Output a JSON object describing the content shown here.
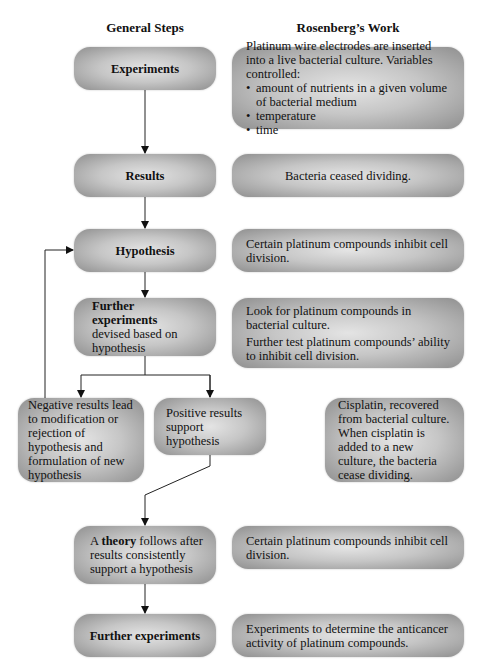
{
  "headers": {
    "left": "General Steps",
    "right": "Rosenberg’s Work"
  },
  "general_steps": {
    "experiments": "Experiments",
    "results": "Results",
    "hypothesis": "Hypothesis",
    "further_experiments_bold": "Further experiments",
    "further_experiments_rest": "devised based on hypothesis",
    "negative": "Negative results lead to modification or rejection of hypothesis and formulation of new hypothesis",
    "positive": "Positive results support hypothesis",
    "theory_prefix": "A ",
    "theory_bold": "theory",
    "theory_rest": " follows after results consistently support a hypothesis",
    "final_experiments": "Further experiments"
  },
  "rosenberg_work": {
    "experiments_intro": "Platinum wire electrodes are inserted into a live bacterial culture. Variables controlled:",
    "variables": [
      "amount of nutrients in a given volume of bacterial medium",
      "temperature",
      "time"
    ],
    "results": "Bacteria ceased dividing.",
    "hypothesis": "Certain platinum compounds inhibit cell division.",
    "further_experiments_1": "Look for platinum compounds in bacterial culture.",
    "further_experiments_2": "Further test platinum compounds’ ability to inhibit cell division.",
    "positive": "Cisplatin, recovered from bacterial culture. When cisplatin is added to a new culture, the bacteria cease dividing.",
    "theory": "Certain platinum compounds inhibit cell division.",
    "final_experiments": "Experiments to determine the anticancer activity of platinum compounds."
  }
}
